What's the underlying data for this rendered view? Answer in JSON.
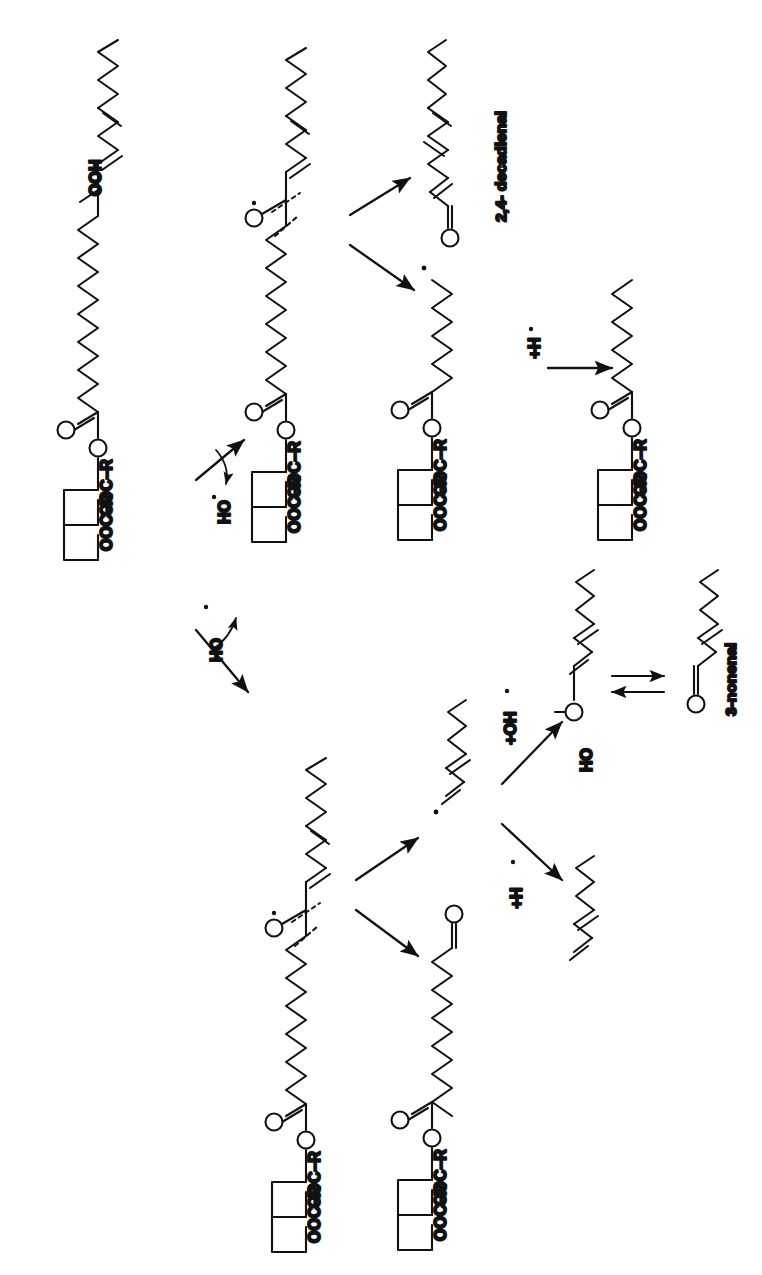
{
  "figure": {
    "kind": "chemical-reaction-scheme",
    "orientation": "rotated-90-ccw",
    "background_color": "#ffffff",
    "line_color": "#111111",
    "canvas": {
      "width": 762,
      "height": 1275
    }
  },
  "labels": {
    "hydroperoxide": "OOH",
    "ester_oxygen": "O",
    "carbonyl_oxygen": "O",
    "sn2_ester": "OOC–R",
    "sn3_ester": "OOC–R",
    "hydroxyl_radical": "HO",
    "radical_dot": "•",
    "enol_hydroxyl": "HO",
    "add_hydrogen_radical": "+H",
    "add_hydroxyl_radical": "+OH",
    "product_decadienal": "2,4- decadienal",
    "product_nonenal": "3-nonenal"
  },
  "reaction_nodes": [
    {
      "id": "start-hydroperoxide",
      "name": "triacylglycerol-linoleate-hydroperoxide",
      "text_labels": [
        "OOH",
        "O",
        "O",
        "OOC–R",
        "OOC–R"
      ]
    },
    {
      "id": "alkoxyl-upper",
      "name": "alkoxyl-radical-upper-branch",
      "text_labels": [
        "O",
        "O",
        "OOC–R",
        "OOC–R"
      ]
    },
    {
      "id": "alkoxyl-lower",
      "name": "alkoxyl-radical-lower-branch",
      "text_labels": [
        "O",
        "O",
        "OOC–R",
        "OOC–R"
      ]
    },
    {
      "id": "glyceryl-radical-upper",
      "name": "carbon-centred-radical-glyceride",
      "text_labels": [
        "O",
        "OOC–R",
        "OOC–R"
      ]
    },
    {
      "id": "glyceryl-saturated-upper",
      "name": "hydrogen-abstracted-glyceride",
      "text_labels": [
        "O",
        "OOC–R",
        "OOC–R"
      ]
    },
    {
      "id": "oxo-glyceride-lower",
      "name": "oxo-nonanoyl-glyceride",
      "text_labels": [
        "O",
        "O",
        "OOC–R",
        "OOC–R"
      ]
    },
    {
      "id": "nonenyl-radical",
      "name": "nonenyl-radical-fragment",
      "text_labels": []
    },
    {
      "id": "enol-nonenol",
      "name": "nonadienol-enol-intermediate",
      "text_labels": [
        "HO"
      ]
    },
    {
      "id": "nonenal",
      "name": "3-nonenal-aldehyde",
      "text_labels": [
        "O",
        "3-nonenal"
      ]
    },
    {
      "id": "nonadiene",
      "name": "nonadiene-hydrogen-adduct",
      "text_labels": []
    },
    {
      "id": "decadienal",
      "name": "2,4-decadienal-aldehyde",
      "text_labels": [
        "O",
        "2,4- decadienal"
      ]
    }
  ],
  "arrows": [
    {
      "id": "a1",
      "name": "arrow-to-upper-branch",
      "annotation": "HO•"
    },
    {
      "id": "a2",
      "name": "arrow-to-lower-branch",
      "annotation": "HO•"
    },
    {
      "id": "a3",
      "name": "arrow-upper-to-decadienal",
      "annotation": ""
    },
    {
      "id": "a4",
      "name": "arrow-upper-to-glyceryl-radical",
      "annotation": ""
    },
    {
      "id": "a5",
      "name": "arrow-glyceryl-radical-to-saturated",
      "annotation": "+H•"
    },
    {
      "id": "a6",
      "name": "arrow-lower-to-nonenyl-radical",
      "annotation": ""
    },
    {
      "id": "a7",
      "name": "arrow-lower-to-oxo-glyceride",
      "annotation": ""
    },
    {
      "id": "a8",
      "name": "arrow-nonenyl-to-enol",
      "annotation": "+OH•"
    },
    {
      "id": "a9",
      "name": "arrow-nonenyl-to-nonadiene",
      "annotation": "+H•"
    },
    {
      "id": "a10",
      "name": "equilibrium-enol-to-nonenal",
      "annotation": ""
    }
  ]
}
